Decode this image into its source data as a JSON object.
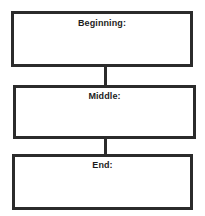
{
  "organizer": {
    "type": "story-sequence-graphic-organizer",
    "background_color": "#ffffff",
    "border_color": "#2b2b2b",
    "text_color": "#1c1c1c",
    "boxes": [
      {
        "id": "beginning",
        "label": "Beginning:",
        "content": ""
      },
      {
        "id": "middle",
        "label": "Middle:",
        "content": ""
      },
      {
        "id": "end",
        "label": "End:",
        "content": ""
      }
    ],
    "connectors": [
      {
        "id": "beginning-middle",
        "from": "beginning",
        "to": "middle"
      },
      {
        "id": "middle-end",
        "from": "middle",
        "to": "end"
      }
    ]
  }
}
